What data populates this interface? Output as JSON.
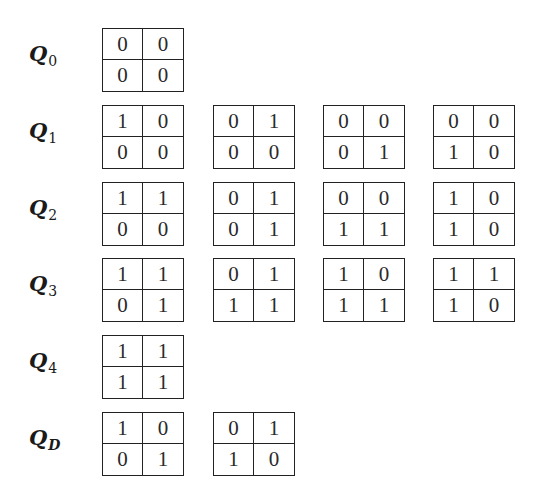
{
  "rows": [
    {
      "label": "Q",
      "subscript": "0",
      "grids": [
        [
          [
            0,
            0
          ],
          [
            0,
            0
          ]
        ]
      ]
    },
    {
      "label": "Q",
      "subscript": "1",
      "grids": [
        [
          [
            1,
            0
          ],
          [
            0,
            0
          ]
        ],
        [
          [
            0,
            1
          ],
          [
            0,
            0
          ]
        ],
        [
          [
            0,
            0
          ],
          [
            0,
            1
          ]
        ],
        [
          [
            0,
            0
          ],
          [
            1,
            0
          ]
        ]
      ]
    },
    {
      "label": "Q",
      "subscript": "2",
      "grids": [
        [
          [
            1,
            1
          ],
          [
            0,
            0
          ]
        ],
        [
          [
            0,
            1
          ],
          [
            0,
            1
          ]
        ],
        [
          [
            0,
            0
          ],
          [
            1,
            1
          ]
        ],
        [
          [
            1,
            0
          ],
          [
            1,
            0
          ]
        ]
      ]
    },
    {
      "label": "Q",
      "subscript": "3",
      "grids": [
        [
          [
            1,
            1
          ],
          [
            0,
            1
          ]
        ],
        [
          [
            0,
            1
          ],
          [
            1,
            1
          ]
        ],
        [
          [
            1,
            0
          ],
          [
            1,
            1
          ]
        ],
        [
          [
            1,
            1
          ],
          [
            1,
            0
          ]
        ]
      ]
    },
    {
      "label": "Q",
      "subscript": "4",
      "grids": [
        [
          [
            1,
            1
          ],
          [
            1,
            1
          ]
        ]
      ]
    },
    {
      "label": "Q",
      "subscript": "D",
      "grids": [
        [
          [
            1,
            0
          ],
          [
            0,
            1
          ]
        ],
        [
          [
            0,
            1
          ],
          [
            1,
            0
          ]
        ]
      ]
    }
  ],
  "colors": {
    "line": "#222222",
    "text": "#1a1a1a",
    "background": "#ffffff"
  }
}
